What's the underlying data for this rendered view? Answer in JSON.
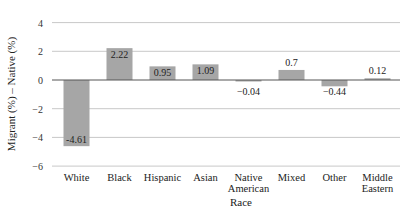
{
  "chart_data": {
    "type": "bar",
    "title": "",
    "xlabel": "Race",
    "ylabel": "Migrant (%) – Native (%)",
    "ylim": [
      -6,
      4
    ],
    "yticks": [
      4,
      2,
      0,
      -2,
      -4,
      -6
    ],
    "ytick_labels": [
      "4",
      "2",
      "0",
      "−2",
      "−4",
      "−6"
    ],
    "grid": true,
    "legend": null,
    "categories": [
      [
        "White"
      ],
      [
        "Black"
      ],
      [
        "Hispanic"
      ],
      [
        "Asian"
      ],
      [
        "Native",
        "American"
      ],
      [
        "Mixed"
      ],
      [
        "Other"
      ],
      [
        "Middle",
        "Eastern"
      ]
    ],
    "values": [
      -4.61,
      2.22,
      0.95,
      1.09,
      -0.04,
      0.7,
      -0.44,
      0.12
    ],
    "value_labels": [
      "-4.61",
      "2.22",
      "0.95",
      "1.09",
      "−0.04",
      "0.7",
      "−0.44",
      "0.12"
    ],
    "bar_color": "#a6a6a6",
    "grid_color": "#c8c8c8",
    "axis_color": "#555555"
  }
}
